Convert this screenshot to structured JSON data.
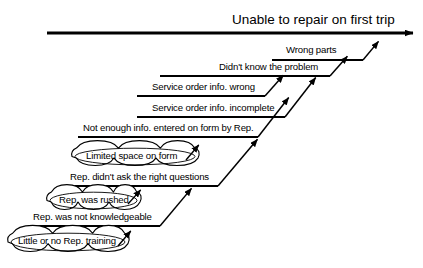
{
  "diagram": {
    "type": "cause-and-effect-cascade",
    "title": "Unable to repair on first trip",
    "background_color": "#ffffff",
    "line_color": "#000000",
    "text_color": "#000000",
    "spine": {
      "label": "Unable to repair on first trip",
      "x_start": 47,
      "x_end": 418,
      "y": 33,
      "arrow_direction": "right"
    },
    "branches": [
      {
        "id": "wrong-parts",
        "label": "Wrong parts",
        "level": 1,
        "line": {
          "x_start": 272,
          "x_end": 363,
          "y": 60
        },
        "text_x": 286,
        "text_y": 45,
        "arrow": {
          "x1": 363,
          "y1": 60,
          "x2": 383,
          "y2": 36
        }
      },
      {
        "id": "didnt-know-the-problem",
        "label": "Didn't know the problem",
        "level": 2,
        "line": {
          "x_start": 160,
          "x_end": 330,
          "y": 76
        },
        "text_x": 219,
        "text_y": 62,
        "arrow": {
          "x1": 330,
          "y1": 76,
          "x2": 352,
          "y2": 51
        }
      },
      {
        "id": "service-order-info-wrong",
        "label": "Service order info. wrong",
        "level": 3,
        "line": {
          "x_start": 137,
          "x_end": 265,
          "y": 96
        },
        "text_x": 152,
        "text_y": 82,
        "arrow": {
          "x1": 265,
          "y1": 96,
          "x2": 288,
          "y2": 70
        }
      },
      {
        "id": "service-order-info-incomplete",
        "label": "Service order info. incomplete",
        "level": 4,
        "line": {
          "x_start": 137,
          "x_end": 285,
          "y": 117
        },
        "text_x": 152,
        "text_y": 103,
        "arrow": {
          "x1": 285,
          "y1": 117,
          "x2": 320,
          "y2": 72
        }
      },
      {
        "id": "not-enough-info-entered-on-form",
        "label": "Not enough info. entered on form by Rep.",
        "level": 5,
        "line": {
          "x_start": 78,
          "x_end": 258,
          "y": 137
        },
        "text_x": 83,
        "text_y": 123,
        "arrow": {
          "x1": 258,
          "y1": 137,
          "x2": 293,
          "y2": 92
        }
      },
      {
        "id": "rep-didnt-ask-right-questions",
        "label": "Rep. didn't ask the right questions",
        "level": 6,
        "line": {
          "x_start": 63,
          "x_end": 218,
          "y": 186
        },
        "text_x": 70,
        "text_y": 172,
        "arrow": {
          "x1": 218,
          "y1": 186,
          "x2": 262,
          "y2": 134
        }
      },
      {
        "id": "rep-was-not-knowledgeable",
        "label": "Rep. was not knowledgeable",
        "level": 7,
        "line": {
          "x_start": 28,
          "x_end": 160,
          "y": 226
        },
        "text_x": 33,
        "text_y": 212,
        "arrow": {
          "x1": 160,
          "y1": 226,
          "x2": 196,
          "y2": 183
        }
      }
    ],
    "clouds": [
      {
        "id": "limited-space-on-form",
        "label": "Limited space on form",
        "x": 72,
        "y": 146,
        "width": 126,
        "height": 21,
        "text_x": 86,
        "text_y": 151,
        "arrow": {
          "x1": 186,
          "y1": 160,
          "x2": 203,
          "y2": 140
        }
      },
      {
        "id": "rep-was-rushed",
        "label": "Rep. was rushed",
        "x": 47,
        "y": 190,
        "width": 93,
        "height": 21,
        "text_x": 59,
        "text_y": 195,
        "arrow": {
          "x1": 128,
          "y1": 204,
          "x2": 145,
          "y2": 185
        }
      },
      {
        "id": "little-or-no-rep-training",
        "label": "Little or no Rep. training",
        "x": 8,
        "y": 231,
        "width": 120,
        "height": 22,
        "text_x": 18,
        "text_y": 236,
        "arrow": {
          "x1": 118,
          "y1": 246,
          "x2": 135,
          "y2": 226
        }
      }
    ]
  }
}
